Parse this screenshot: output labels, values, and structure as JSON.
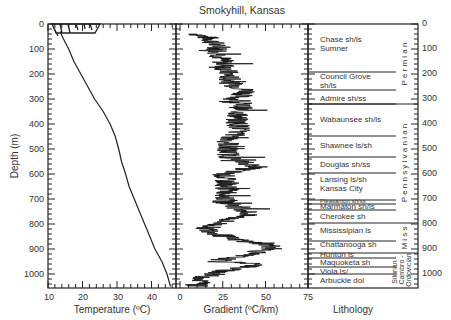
{
  "chart_data": [
    {
      "type": "line",
      "title": "",
      "xlabel": "Temperature (ºC)",
      "ylabel": "Depth (m)",
      "xlim": [
        10,
        47
      ],
      "ylim": [
        1050,
        0
      ],
      "x_ticks": [
        "10",
        "20",
        "30",
        "40"
      ],
      "y_ticks": [
        "0",
        "100",
        "200",
        "300",
        "400",
        "500",
        "600",
        "700",
        "800",
        "900",
        "1000"
      ],
      "series": [
        {
          "name": "Temperature",
          "points": [
            [
              13.5,
              30
            ],
            [
              14.5,
              60
            ],
            [
              16,
              100
            ],
            [
              17.5,
              150
            ],
            [
              19.5,
              200
            ],
            [
              21.5,
              250
            ],
            [
              23.5,
              300
            ],
            [
              26,
              350
            ],
            [
              28,
              400
            ],
            [
              29.5,
              450
            ],
            [
              30.5,
              500
            ],
            [
              31.3,
              550
            ],
            [
              32.5,
              600
            ],
            [
              33.5,
              650
            ],
            [
              35,
              700
            ],
            [
              36.5,
              750
            ],
            [
              38,
              800
            ],
            [
              39.5,
              850
            ],
            [
              41,
              900
            ],
            [
              43,
              950
            ],
            [
              44.5,
              1000
            ],
            [
              45.5,
              1050
            ]
          ]
        }
      ],
      "annotations": [
        "surface transient profiles 0–40 m, 12–30 ºC"
      ]
    },
    {
      "type": "line",
      "title": "Smokyhill, Kansas",
      "xlabel": "Gradient (ºC/km)",
      "ylabel": "",
      "xlim": [
        0,
        75
      ],
      "ylim": [
        1050,
        0
      ],
      "x_ticks": [
        "0",
        "25",
        "50",
        "75"
      ],
      "series": [
        {
          "name": "Gradient",
          "points": [
            [
              10,
              40
            ],
            [
              18,
              60
            ],
            [
              22,
              100
            ],
            [
              25,
              150
            ],
            [
              28,
              200
            ],
            [
              30,
              240
            ],
            [
              40,
              270
            ],
            [
              32,
              300
            ],
            [
              36,
              330
            ],
            [
              33,
              380
            ],
            [
              35,
              420
            ],
            [
              30,
              460
            ],
            [
              27,
              500
            ],
            [
              30,
              540
            ],
            [
              45,
              570
            ],
            [
              25,
              600
            ],
            [
              27,
              640
            ],
            [
              28,
              680
            ],
            [
              25,
              710
            ],
            [
              38,
              740
            ],
            [
              40,
              760
            ],
            [
              25,
              790
            ],
            [
              15,
              820
            ],
            [
              30,
              860
            ],
            [
              50,
              880
            ],
            [
              55,
              895
            ],
            [
              40,
              920
            ],
            [
              20,
              950
            ],
            [
              50,
              960
            ],
            [
              30,
              980
            ],
            [
              15,
              1010
            ],
            [
              10,
              1040
            ]
          ]
        }
      ]
    },
    {
      "type": "table",
      "title": "Lithology",
      "ylim": [
        1050,
        0
      ],
      "right_axis_ticks": [
        "0",
        "100",
        "200",
        "300",
        "400",
        "500",
        "600",
        "700",
        "800",
        "900",
        "1000"
      ],
      "units": [
        {
          "name": "Chase sh/ls",
          "top": 0,
          "base": 195
        },
        {
          "name": "Sumner",
          "top": 0,
          "base": 195
        },
        {
          "name": "Council Grove sh/ls",
          "top": 195,
          "base": 265
        },
        {
          "name": "Admire sh/ss",
          "top": 265,
          "base": 320
        },
        {
          "name": "Wabaunsee sh/ls",
          "top": 320,
          "base": 450
        },
        {
          "name": "Shawnee ls/sh",
          "top": 450,
          "base": 535
        },
        {
          "name": "Douglas sh/ss",
          "top": 535,
          "base": 600
        },
        {
          "name": "Lansing ls/sh Kansas City",
          "top": 600,
          "base": 705
        },
        {
          "name": "Pleasanton sh/ss",
          "top": 705,
          "base": 720
        },
        {
          "name": "Marmaton sh/ls",
          "top": 720,
          "base": 745
        },
        {
          "name": "Cherokee sh",
          "top": 745,
          "base": 800
        },
        {
          "name": "Mississipian ls",
          "top": 800,
          "base": 870
        },
        {
          "name": "Chattanooga sh",
          "top": 870,
          "base": 915
        },
        {
          "name": "Hunton ls",
          "top": 915,
          "base": 935
        },
        {
          "name": "Maquoketa sh",
          "top": 935,
          "base": 975
        },
        {
          "name": "Viola ls/",
          "top": 975,
          "base": 1000
        },
        {
          "name": "Arbuckle dol",
          "top": 1000,
          "base": 1050
        }
      ],
      "systems": [
        {
          "name": "Permian",
          "top": 0,
          "base": 320
        },
        {
          "name": "Pennsylvanian",
          "top": 320,
          "base": 800
        },
        {
          "name": "Miss.",
          "top": 800,
          "base": 915
        },
        {
          "name": "Silurian - Cambro - Ordovician",
          "top": 915,
          "base": 1050
        }
      ]
    }
  ],
  "labels": {
    "title": "Smokyhill, Kansas",
    "depth_axis": "Depth (m)",
    "temp_axis": "Temperature (ºC)",
    "grad_axis": "Gradient (ºC/km)",
    "litho_axis": "Lithology",
    "temp_ticks": [
      "10",
      "20",
      "30",
      "40"
    ],
    "grad_ticks": [
      "0",
      "25",
      "50",
      "75"
    ],
    "depth_ticks": [
      "0",
      "100",
      "200",
      "300",
      "400",
      "500",
      "600",
      "700",
      "800",
      "900",
      "1000"
    ],
    "litho": {
      "chase": "Chase sh/ls",
      "sumner": "Sumner",
      "council1": "Council Grove",
      "council2": "sh/ls",
      "admire": "Admire sh/ss",
      "wabaunsee": "Wabaunsee sh/ls",
      "shawnee": "Shawnee ls/sh",
      "douglas": "Douglas sh/ss",
      "lansing": "Lansing   ls/sh",
      "kc": "Kansas City",
      "pleasanton": "Pleasanton sh/ss",
      "marmaton": "Marmaton sh/ls",
      "cherokee": "Cherokee sh",
      "mississipian": "Mississipian ls",
      "chattanooga": "Chattanooga sh",
      "hunton": "Hunton ls",
      "maquoketa": "Maquoketa sh",
      "viola": "Viola ls/",
      "arbuckle": "Arbuckle dol"
    },
    "systems": {
      "permian": "P e r m i a n",
      "penn": "P e n n s y l v a n i a n",
      "miss": "M i s s",
      "silurian": "Silurian -",
      "cambro": "Cambro -",
      "ordovician": "Ordovician"
    }
  }
}
